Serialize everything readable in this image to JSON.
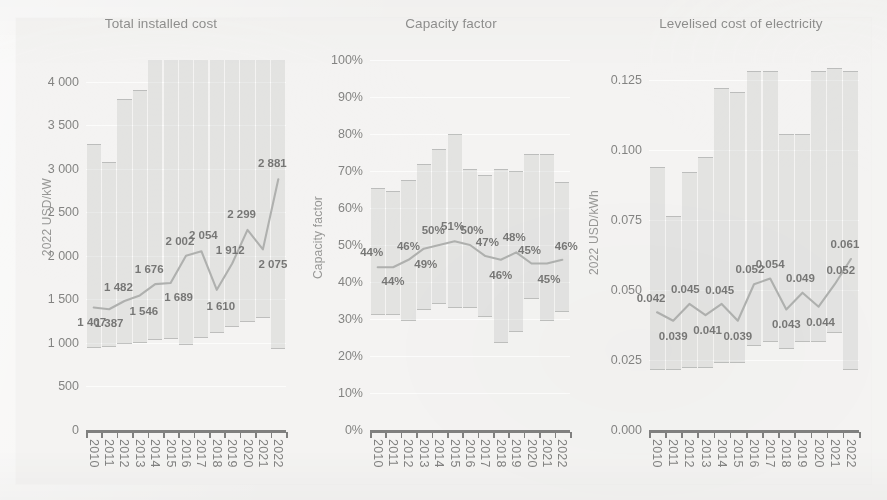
{
  "figure": {
    "background_color": "#efeeec",
    "band_color": "#a0a3a0",
    "line_color": "#8d8f8c",
    "years": [
      "2010",
      "2011",
      "2012",
      "2013",
      "2014",
      "2015",
      "2016",
      "2017",
      "2018",
      "2019",
      "2020",
      "2021",
      "2022"
    ]
  },
  "panels": [
    {
      "id": "total-installed-cost",
      "title": "Total installed cost",
      "ylabel": "2022 USD/kW",
      "yticks": [
        "0",
        "500",
        "1 000",
        "1 500",
        "2 000",
        "2 500",
        "3 000",
        "3 500",
        "4 000"
      ],
      "data_labels": [
        "1 407",
        "1 387",
        "1 482",
        "1 546",
        "1 676",
        "1 689",
        "2 002",
        "2 054",
        "1 610",
        "1 912",
        "2 299",
        "2 075",
        "2 881"
      ]
    },
    {
      "id": "capacity-factor",
      "title": "Capacity factor",
      "ylabel": "Capacity factor",
      "yticks": [
        "0%",
        "10%",
        "20%",
        "30%",
        "40%",
        "50%",
        "60%",
        "70%",
        "80%",
        "90%",
        "100%"
      ],
      "data_labels": [
        "44%",
        "44%",
        "46%",
        "49%",
        "50%",
        "51%",
        "50%",
        "47%",
        "46%",
        "48%",
        "45%",
        "45%",
        "46%"
      ]
    },
    {
      "id": "levelised-cost-of-electricity",
      "title": "Levelised cost of electricity",
      "ylabel": "2022 USD/kWh",
      "yticks": [
        "0.000",
        "0.025",
        "0.050",
        "0.075",
        "0.100",
        "0.125"
      ],
      "data_labels": [
        "0.042",
        "0.039",
        "0.045",
        "0.041",
        "0.045",
        "0.039",
        "0.052",
        "0.054",
        "0.043",
        "0.049",
        "0.044",
        "0.052",
        "0.061"
      ]
    }
  ],
  "chart_data": [
    {
      "type": "line",
      "id": "total-installed-cost",
      "title": "Total installed cost",
      "xlabel": "",
      "ylabel": "2022 USD/kW",
      "ylim": [
        0,
        4250
      ],
      "ytick_values": [
        0,
        500,
        1000,
        1500,
        2000,
        2500,
        3000,
        3500,
        4000
      ],
      "grid": true,
      "legend": "none",
      "x": [
        "2010",
        "2011",
        "2012",
        "2013",
        "2014",
        "2015",
        "2016",
        "2017",
        "2018",
        "2019",
        "2020",
        "2021",
        "2022"
      ],
      "series": [
        {
          "name": "Weighted average",
          "values": [
            1407,
            1387,
            1482,
            1546,
            1676,
            1689,
            2002,
            2054,
            1610,
            1912,
            2299,
            2075,
            2881
          ],
          "labelled": true
        },
        {
          "name": "5th percentile (band bottom)",
          "values": [
            940,
            955,
            985,
            1000,
            1030,
            1040,
            975,
            1055,
            1110,
            1185,
            1245,
            1290,
            935
          ]
        },
        {
          "name": "95th percentile (band top)",
          "values": [
            3290,
            3075,
            3800,
            3900,
            4300,
            4300,
            4300,
            4300,
            4300,
            4300,
            4300,
            4300,
            4300
          ]
        }
      ]
    },
    {
      "type": "line",
      "id": "capacity-factor",
      "title": "Capacity factor",
      "xlabel": "",
      "ylabel": "Capacity factor",
      "ylim": [
        0,
        100
      ],
      "ytick_values": [
        0,
        10,
        20,
        30,
        40,
        50,
        60,
        70,
        80,
        90,
        100
      ],
      "unit": "%",
      "grid": true,
      "legend": "none",
      "x": [
        "2010",
        "2011",
        "2012",
        "2013",
        "2014",
        "2015",
        "2016",
        "2017",
        "2018",
        "2019",
        "2020",
        "2021",
        "2022"
      ],
      "series": [
        {
          "name": "Weighted average",
          "values": [
            44,
            44,
            46,
            49,
            50,
            51,
            50,
            47,
            46,
            48,
            45,
            45,
            46
          ],
          "labelled": true
        },
        {
          "name": "5th percentile (band bottom)",
          "values": [
            31,
            31,
            29.5,
            32.5,
            34,
            33,
            33,
            30.5,
            23.5,
            26.5,
            35.5,
            29.5,
            32
          ]
        },
        {
          "name": "95th percentile (band top)",
          "values": [
            65.5,
            64.5,
            67.5,
            72,
            76,
            80,
            70.5,
            69,
            70.5,
            70,
            74.5,
            74.5,
            67
          ]
        }
      ]
    },
    {
      "type": "line",
      "id": "levelised-cost-of-electricity",
      "title": "Levelised cost of electricity",
      "xlabel": "",
      "ylabel": "2022 USD/kWh",
      "ylim": [
        0,
        0.132
      ],
      "ytick_values": [
        0,
        0.025,
        0.05,
        0.075,
        0.1,
        0.125
      ],
      "grid": true,
      "legend": "none",
      "x": [
        "2010",
        "2011",
        "2012",
        "2013",
        "2014",
        "2015",
        "2016",
        "2017",
        "2018",
        "2019",
        "2020",
        "2021",
        "2022"
      ],
      "series": [
        {
          "name": "Weighted average",
          "values": [
            0.042,
            0.039,
            0.045,
            0.041,
            0.045,
            0.039,
            0.052,
            0.054,
            0.043,
            0.049,
            0.044,
            0.052,
            0.061
          ],
          "labelled": true
        },
        {
          "name": "5th percentile (band bottom)",
          "values": [
            0.0215,
            0.0215,
            0.0222,
            0.0222,
            0.0238,
            0.024,
            0.03,
            0.0313,
            0.029,
            0.0313,
            0.0313,
            0.0345,
            0.0215
          ]
        },
        {
          "name": "95th percentile (band top)",
          "values": [
            0.0938,
            0.0762,
            0.0922,
            0.0975,
            0.122,
            0.1205,
            0.128,
            0.128,
            0.1057,
            0.1057,
            0.128,
            0.129,
            0.128
          ]
        }
      ]
    }
  ]
}
